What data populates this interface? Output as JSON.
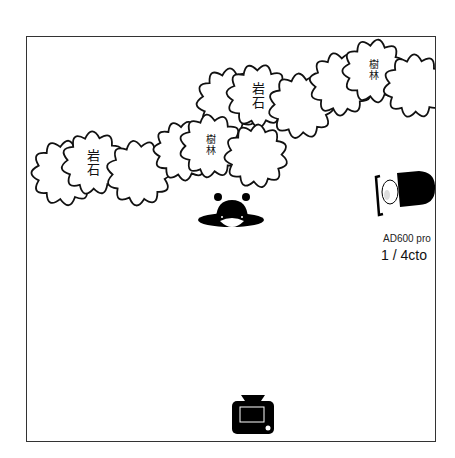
{
  "diagram": {
    "type": "lighting-setup",
    "frame": {
      "border_color": "#333333",
      "background": "#ffffff"
    },
    "obstacles": [
      {
        "kind": "cloud",
        "label": "",
        "cx": 37,
        "cy": 136,
        "r": 33
      },
      {
        "kind": "cloud",
        "label": "岩石",
        "cx": 66,
        "cy": 126,
        "r": 32
      },
      {
        "kind": "cloud",
        "label": "",
        "cx": 112,
        "cy": 136,
        "r": 33
      },
      {
        "kind": "cloud",
        "label": "",
        "cx": 156,
        "cy": 114,
        "r": 30
      },
      {
        "kind": "cloud",
        "label": "",
        "cx": 202,
        "cy": 64,
        "r": 33
      },
      {
        "kind": "cloud",
        "label": "樹林",
        "cx": 184,
        "cy": 109,
        "r": 32
      },
      {
        "kind": "cloud",
        "label": "岩石",
        "cx": 231,
        "cy": 59,
        "r": 32
      },
      {
        "kind": "cloud",
        "label": "",
        "cx": 229,
        "cy": 119,
        "r": 32
      },
      {
        "kind": "cloud",
        "label": "",
        "cx": 274,
        "cy": 69,
        "r": 33
      },
      {
        "kind": "cloud",
        "label": "",
        "cx": 314,
        "cy": 47,
        "r": 32
      },
      {
        "kind": "cloud",
        "label": "樹林",
        "cx": 347,
        "cy": 34,
        "r": 32
      },
      {
        "kind": "cloud",
        "label": "",
        "cx": 388,
        "cy": 49,
        "r": 32
      }
    ],
    "labels": {
      "rock": "岩石",
      "forest": "樹林"
    },
    "subject": {
      "icon": "person-top-view-icon",
      "cx": 205,
      "cy": 180
    },
    "light": {
      "icon": "strobe-light-icon",
      "model": "AD600 pro",
      "power": "1 / 4cto"
    },
    "camera": {
      "icon": "camera-icon",
      "cx": 227,
      "cy": 380
    }
  }
}
